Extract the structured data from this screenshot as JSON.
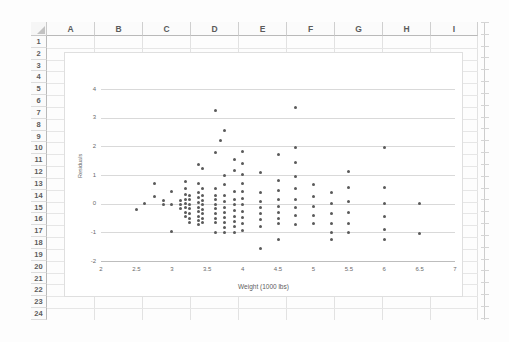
{
  "app": {
    "type": "spreadsheet-with-embedded-chart"
  },
  "sheet": {
    "columns": [
      "A",
      "B",
      "C",
      "D",
      "E",
      "F",
      "G",
      "H",
      "I"
    ],
    "rows": [
      "1",
      "2",
      "3",
      "4",
      "5",
      "6",
      "7",
      "8",
      "9",
      "10",
      "11",
      "12",
      "13",
      "14",
      "15",
      "16",
      "17",
      "18",
      "19",
      "20",
      "21",
      "22",
      "23",
      "24"
    ],
    "select_all_icon": "select-all-triangle-icon"
  },
  "chart_data": {
    "type": "scatter",
    "title": "",
    "xlabel": "Weight (1000 lbs)",
    "ylabel": "Residuals",
    "xlim": [
      2,
      7
    ],
    "ylim": [
      -2,
      4
    ],
    "xticks": [
      2,
      2.5,
      3,
      3.5,
      4,
      4.5,
      5,
      5.5,
      6,
      6.5,
      7
    ],
    "yticks": [
      -2,
      -1,
      0,
      1,
      2,
      3,
      4
    ],
    "grid": "horizontal",
    "legend": "none",
    "marker_color": "#5a5a5a",
    "points": [
      [
        2.5,
        -0.22
      ],
      [
        2.62,
        0.02
      ],
      [
        2.75,
        0.71
      ],
      [
        2.75,
        0.24
      ],
      [
        2.88,
        0.1
      ],
      [
        2.88,
        -0.03
      ],
      [
        3.0,
        0.44
      ],
      [
        3.0,
        -0.03
      ],
      [
        3.0,
        -0.97
      ],
      [
        3.12,
        0.12
      ],
      [
        3.12,
        -0.02
      ],
      [
        3.12,
        -0.18
      ],
      [
        3.19,
        0.76
      ],
      [
        3.19,
        0.52
      ],
      [
        3.19,
        0.33
      ],
      [
        3.19,
        0.16
      ],
      [
        3.19,
        0.0
      ],
      [
        3.19,
        -0.14
      ],
      [
        3.19,
        -0.3
      ],
      [
        3.19,
        -0.46
      ],
      [
        3.25,
        0.3
      ],
      [
        3.25,
        0.13
      ],
      [
        3.25,
        -0.02
      ],
      [
        3.25,
        -0.17
      ],
      [
        3.25,
        -0.33
      ],
      [
        3.25,
        -0.5
      ],
      [
        3.25,
        -0.64
      ],
      [
        3.38,
        1.38
      ],
      [
        3.38,
        0.7
      ],
      [
        3.38,
        0.38
      ],
      [
        3.38,
        0.22
      ],
      [
        3.38,
        0.05
      ],
      [
        3.38,
        -0.12
      ],
      [
        3.38,
        -0.28
      ],
      [
        3.38,
        -0.44
      ],
      [
        3.38,
        -0.6
      ],
      [
        3.38,
        -0.72
      ],
      [
        3.44,
        1.22
      ],
      [
        3.44,
        0.52
      ],
      [
        3.44,
        0.28
      ],
      [
        3.44,
        0.12
      ],
      [
        3.44,
        -0.04
      ],
      [
        3.44,
        -0.2
      ],
      [
        3.44,
        -0.36
      ],
      [
        3.44,
        -0.52
      ],
      [
        3.44,
        -0.66
      ],
      [
        3.62,
        3.24
      ],
      [
        3.62,
        1.8
      ],
      [
        3.62,
        0.54
      ],
      [
        3.62,
        0.3
      ],
      [
        3.62,
        0.14
      ],
      [
        3.62,
        -0.02
      ],
      [
        3.62,
        -0.18
      ],
      [
        3.62,
        -0.34
      ],
      [
        3.62,
        -0.5
      ],
      [
        3.62,
        -0.66
      ],
      [
        3.62,
        -1.01
      ],
      [
        3.69,
        2.22
      ],
      [
        3.75,
        2.56
      ],
      [
        3.75,
        0.98
      ],
      [
        3.75,
        0.67
      ],
      [
        3.75,
        0.3
      ],
      [
        3.75,
        0.06
      ],
      [
        3.75,
        -0.12
      ],
      [
        3.75,
        -0.3
      ],
      [
        3.75,
        -0.48
      ],
      [
        3.75,
        -0.64
      ],
      [
        3.75,
        -0.82
      ],
      [
        3.75,
        -1.0
      ],
      [
        3.88,
        1.54
      ],
      [
        3.88,
        1.16
      ],
      [
        3.88,
        0.42
      ],
      [
        3.88,
        0.16
      ],
      [
        3.88,
        -0.04
      ],
      [
        3.88,
        -0.24
      ],
      [
        3.88,
        -0.44
      ],
      [
        3.88,
        -0.62
      ],
      [
        3.88,
        -0.8
      ],
      [
        3.88,
        -1.0
      ],
      [
        4.0,
        1.82
      ],
      [
        4.0,
        1.4
      ],
      [
        4.0,
        1.02
      ],
      [
        4.0,
        0.7
      ],
      [
        4.0,
        0.42
      ],
      [
        4.0,
        0.18
      ],
      [
        4.0,
        -0.04
      ],
      [
        4.0,
        -0.26
      ],
      [
        4.0,
        -0.48
      ],
      [
        4.0,
        -0.7
      ],
      [
        4.0,
        -0.92
      ],
      [
        4.25,
        1.08
      ],
      [
        4.25,
        0.4
      ],
      [
        4.25,
        0.08
      ],
      [
        4.25,
        -0.14
      ],
      [
        4.25,
        -0.36
      ],
      [
        4.25,
        -0.56
      ],
      [
        4.25,
        -0.78
      ],
      [
        4.25,
        -1.58
      ],
      [
        4.5,
        1.7
      ],
      [
        4.5,
        0.82
      ],
      [
        4.5,
        0.45
      ],
      [
        4.5,
        0.14
      ],
      [
        4.5,
        -0.1
      ],
      [
        4.5,
        -0.32
      ],
      [
        4.5,
        -0.52
      ],
      [
        4.5,
        -0.68
      ],
      [
        4.5,
        -1.26
      ],
      [
        4.75,
        3.37
      ],
      [
        4.75,
        1.97
      ],
      [
        4.75,
        1.42
      ],
      [
        4.75,
        0.94
      ],
      [
        4.75,
        0.52
      ],
      [
        4.75,
        0.16
      ],
      [
        4.75,
        -0.14
      ],
      [
        4.75,
        -0.42
      ],
      [
        4.75,
        -0.72
      ],
      [
        5.0,
        0.67
      ],
      [
        5.0,
        0.25
      ],
      [
        5.0,
        -0.1
      ],
      [
        5.0,
        -0.4
      ],
      [
        5.0,
        -0.7
      ],
      [
        5.25,
        0.4
      ],
      [
        5.25,
        0.0
      ],
      [
        5.25,
        -0.36
      ],
      [
        5.25,
        -0.7
      ],
      [
        5.25,
        -1.0
      ],
      [
        5.25,
        -1.25
      ],
      [
        5.5,
        1.11
      ],
      [
        5.5,
        0.56
      ],
      [
        5.5,
        0.09
      ],
      [
        5.5,
        -0.3
      ],
      [
        5.5,
        -0.68
      ],
      [
        5.5,
        -1.0
      ],
      [
        6.0,
        1.96
      ],
      [
        6.0,
        0.56
      ],
      [
        6.0,
        0.01
      ],
      [
        6.0,
        -0.46
      ],
      [
        6.0,
        -0.9
      ],
      [
        6.0,
        -1.24
      ],
      [
        6.5,
        0.0
      ],
      [
        6.5,
        -1.04
      ]
    ]
  }
}
